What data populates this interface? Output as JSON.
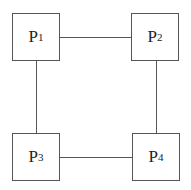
{
  "diagram": {
    "type": "ring-network",
    "nodes": [
      {
        "id": "P1",
        "letter": "P",
        "sub": "1",
        "x": 12,
        "y": 13
      },
      {
        "id": "P2",
        "letter": "P",
        "sub": "2",
        "x": 131,
        "y": 13
      },
      {
        "id": "P3",
        "letter": "P",
        "sub": "3",
        "x": 12,
        "y": 133
      },
      {
        "id": "P4",
        "letter": "P",
        "sub": "4",
        "x": 132,
        "y": 133
      }
    ],
    "edges": [
      {
        "from": "P1",
        "to": "P2"
      },
      {
        "from": "P2",
        "to": "P4"
      },
      {
        "from": "P4",
        "to": "P3"
      },
      {
        "from": "P3",
        "to": "P1"
      }
    ],
    "colors": {
      "stroke": "#555555",
      "text": "#222222",
      "background": "#ffffff"
    }
  }
}
